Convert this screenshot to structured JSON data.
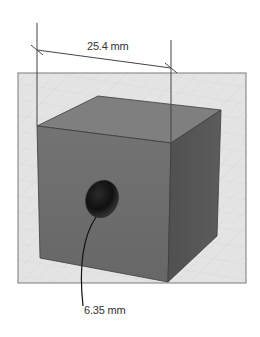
{
  "diagram": {
    "type": "3d-cube-dimension-drawing",
    "object": "cube with circular hole",
    "dimensions": {
      "edge_length": {
        "label": "25.4 mm",
        "value": 25.4,
        "unit": "mm"
      },
      "hole_diameter": {
        "label": "6.35 mm",
        "value": 6.35,
        "unit": "mm"
      }
    },
    "colors": {
      "background": "#ffffff",
      "grid_panel": "#e4e4e4",
      "grid_lines": "#cfcfcf",
      "panel_border": "#7a7a7a",
      "cube_top": "#7f7f7f",
      "cube_front": "#6e6e6e",
      "cube_right": "#545454",
      "cube_edge": "#3c3c3c",
      "hole": "#111111",
      "dimension_line": "#444444",
      "leader_line": "#111111"
    }
  }
}
